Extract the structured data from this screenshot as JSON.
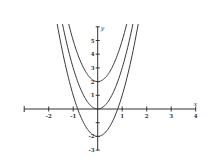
{
  "chart_data": {
    "type": "line",
    "title": "",
    "xlabel": "x",
    "ylabel": "y",
    "xlim": [
      -3,
      4
    ],
    "ylim": [
      -3,
      6
    ],
    "grid": false,
    "legend": null,
    "x_ticks": [
      -2,
      -1,
      1,
      2,
      3,
      4
    ],
    "x_tick_labels": [
      "-2",
      "-1",
      "1",
      "2",
      "3",
      "4"
    ],
    "y_ticks": [
      -3,
      -2,
      -1,
      1,
      2,
      3,
      4,
      5
    ],
    "y_tick_labels": [
      "-3",
      "-2",
      "",
      "1",
      "2",
      "3",
      "4",
      "5"
    ],
    "series": [
      {
        "name": "y = 3x^2 + 2",
        "a": 3,
        "c": 2,
        "vertex": [
          0,
          2
        ],
        "x": [
          -1.1,
          -0.5,
          0,
          0.5,
          1.1
        ],
        "values": [
          5.63,
          2.75,
          2,
          2.75,
          5.63
        ]
      },
      {
        "name": "y = 3x^2",
        "a": 3,
        "c": 0,
        "vertex": [
          0,
          0
        ],
        "x": [
          -1.4,
          -0.7,
          0,
          0.7,
          1.4
        ],
        "values": [
          5.88,
          1.47,
          0,
          1.47,
          5.88
        ]
      },
      {
        "name": "y = 3x^2 - 2",
        "a": 3,
        "c": -2,
        "vertex": [
          0,
          -2
        ],
        "x": [
          -1.65,
          -0.82,
          0,
          0.82,
          1.65
        ],
        "values": [
          6.17,
          0.02,
          -2,
          0.02,
          6.17
        ]
      }
    ],
    "curve_color": "#3a3a3a",
    "axis_color": "#333333"
  }
}
